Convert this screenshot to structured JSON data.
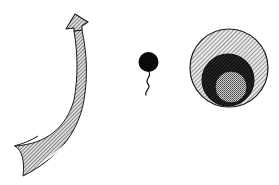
{
  "figure": {
    "kind": "illustration",
    "background": "#ffffff",
    "elements": [
      {
        "id": "curved-arrow",
        "description": "Hatched curved arrow sweeping upward from bottom-left, pointing up",
        "fill_style": "diagonal-hatch",
        "stroke": "#222222"
      },
      {
        "id": "cell-with-tail",
        "description": "Solid black circle with wavy tail hanging below",
        "fill": "#0a0a0a"
      },
      {
        "id": "nested-circles",
        "description": "Large hatched circle containing a dark circle containing a small stippled circle",
        "layers": [
          {
            "name": "outer",
            "fill_style": "light-diagonal-hatch",
            "color": "#8a8a8a"
          },
          {
            "name": "middle",
            "fill_style": "dark-diagonal-hatch",
            "color": "#2a2a2a"
          },
          {
            "name": "inner",
            "fill_style": "stipple",
            "color": "#9a9a9a"
          }
        ]
      }
    ]
  },
  "colors": {
    "ink": "#1a1a1a",
    "hatch_light": "#7a7a7a",
    "hatch_dark": "#1e1e1e",
    "stipple": "#b0b0b0"
  }
}
